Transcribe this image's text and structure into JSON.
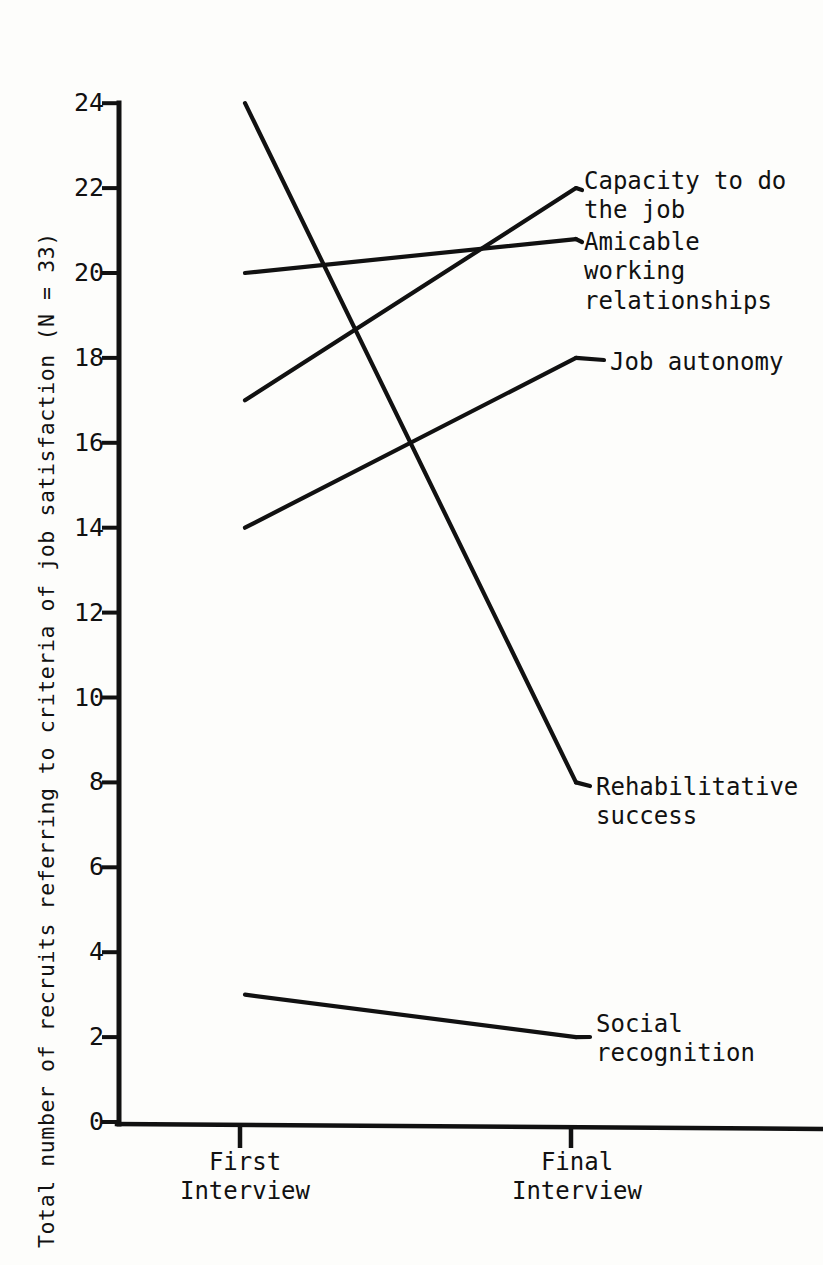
{
  "axis": {
    "y_title": "Total number of recruits referring to criteria of job satisfaction (N = 33)",
    "y_ticks": [
      "24",
      "22",
      "20",
      "18",
      "16",
      "14",
      "12",
      "10",
      "8",
      "6",
      "4",
      "2",
      "0"
    ],
    "x_tick_first": "First\nInterview",
    "x_tick_final": "Final\nInterview"
  },
  "labels": {
    "capacity": "Capacity to do\nthe job",
    "amicable": "Amicable\nworking\nrelationships",
    "autonomy": "Job autonomy",
    "rehabilitative": "Rehabilitative\nsuccess",
    "social": "Social\nrecognition"
  },
  "colors": {
    "ink": "#111111",
    "paper": "#fdfdfb"
  },
  "chart_data": {
    "type": "line",
    "title": "",
    "xlabel": "",
    "ylabel": "Total number of recruits referring to criteria of job satisfaction (N = 33)",
    "categories": [
      "First Interview",
      "Final Interview"
    ],
    "x": [
      "First Interview",
      "Final Interview"
    ],
    "ylim": [
      0,
      24
    ],
    "ytick_values": [
      24,
      22,
      20,
      18,
      16,
      14,
      12,
      10,
      8,
      6,
      4,
      2,
      0
    ],
    "grid": false,
    "legend": "inline-right-end-labels",
    "series": [
      {
        "name": "Rehabilitative success",
        "values": [
          24,
          8
        ]
      },
      {
        "name": "Amicable working relationships",
        "values": [
          20,
          20.8
        ]
      },
      {
        "name": "Capacity to do the job",
        "values": [
          17,
          22
        ]
      },
      {
        "name": "Job autonomy",
        "values": [
          14,
          18
        ]
      },
      {
        "name": "Social recognition",
        "values": [
          3,
          2
        ]
      }
    ]
  },
  "geometry": {
    "x_first_px": 245,
    "x_final_px": 576,
    "y_zero_px": 1122,
    "px_per_unit": 42.45,
    "axis_x_px": 119
  }
}
